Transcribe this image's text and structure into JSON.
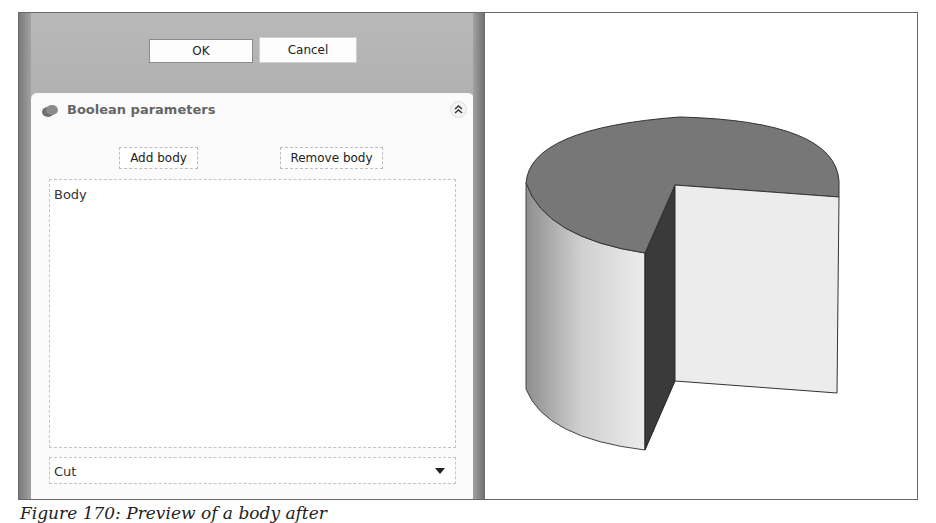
{
  "dialog": {
    "ok_label": "OK",
    "cancel_label": "Cancel"
  },
  "panel": {
    "title": "Boolean parameters",
    "icon": "boolean-parts-icon",
    "collapse_icon": "double-chevron-up-icon",
    "add_body_label": "Add body",
    "remove_body_label": "Remove body",
    "bodies": [
      "Body"
    ],
    "operation": {
      "selected": "Cut",
      "icon": "dropdown-arrow-icon"
    }
  },
  "viewport": {
    "object": "cylinder-with-cut-sector",
    "colors": {
      "top_face": "#777777",
      "cut_face": "#ececec",
      "inner_wall": "#3a3a3a",
      "side": "#d6d6d6"
    }
  },
  "caption": "Figure 170: Preview of a body after"
}
